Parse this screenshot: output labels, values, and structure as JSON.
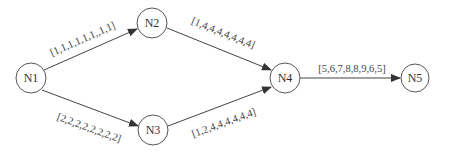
{
  "diagram": {
    "type": "directed-graph",
    "nodes": [
      {
        "id": "N1",
        "label": "N1",
        "x": 31,
        "y": 78
      },
      {
        "id": "N2",
        "label": "N2",
        "x": 152,
        "y": 23
      },
      {
        "id": "N3",
        "label": "N3",
        "x": 153,
        "y": 130
      },
      {
        "id": "N4",
        "label": "N4",
        "x": 285,
        "y": 78
      },
      {
        "id": "N5",
        "label": "N5",
        "x": 415,
        "y": 78
      }
    ],
    "edges": [
      {
        "from": "N1",
        "to": "N2",
        "label": "[1,1,1,1,1,1,,1,1]"
      },
      {
        "from": "N1",
        "to": "N3",
        "label": "[2,2,2,2,2,2,2,2]"
      },
      {
        "from": "N2",
        "to": "N4",
        "label": "[1,4,4,4,4,4,4,4]"
      },
      {
        "from": "N3",
        "to": "N4",
        "label": "[1,2,4,4,4,4,4,4]"
      },
      {
        "from": "N4",
        "to": "N5",
        "label": "[5,6,7,8,8,9,6,5]"
      }
    ]
  }
}
